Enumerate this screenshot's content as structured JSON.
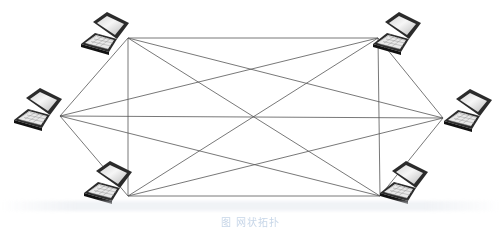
{
  "diagram": {
    "type": "full-mesh",
    "node_icon": "laptop-icon",
    "line_color": "#555555",
    "nodes": [
      {
        "id": "A",
        "label": "laptop-top-left",
        "x": 105,
        "y": 36,
        "port": [
          128,
          38
        ]
      },
      {
        "id": "B",
        "label": "laptop-top-right",
        "x": 397,
        "y": 36,
        "port": [
          378,
          38
        ]
      },
      {
        "id": "C",
        "label": "laptop-left",
        "x": 38,
        "y": 112,
        "port": [
          60,
          116
        ]
      },
      {
        "id": "D",
        "label": "laptop-right",
        "x": 468,
        "y": 113,
        "port": [
          443,
          118
        ]
      },
      {
        "id": "E",
        "label": "laptop-bottom-left",
        "x": 108,
        "y": 185,
        "port": [
          128,
          196
        ]
      },
      {
        "id": "F",
        "label": "laptop-bottom-right",
        "x": 404,
        "y": 185,
        "port": [
          380,
          196
        ]
      }
    ],
    "edges": [
      [
        "A",
        "B"
      ],
      [
        "A",
        "C"
      ],
      [
        "A",
        "D"
      ],
      [
        "A",
        "E"
      ],
      [
        "A",
        "F"
      ],
      [
        "B",
        "C"
      ],
      [
        "B",
        "D"
      ],
      [
        "B",
        "E"
      ],
      [
        "B",
        "F"
      ],
      [
        "C",
        "D"
      ],
      [
        "C",
        "E"
      ],
      [
        "C",
        "F"
      ],
      [
        "D",
        "E"
      ],
      [
        "D",
        "F"
      ],
      [
        "E",
        "F"
      ]
    ],
    "caption": "图 网状拓扑"
  }
}
